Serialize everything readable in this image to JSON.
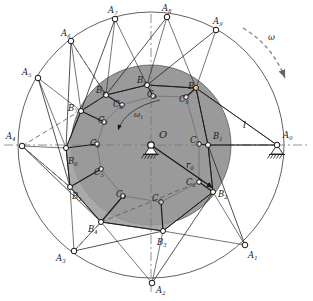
{
  "figure": {
    "background_color": "#ffffff",
    "disc_fill": "#9a9a9a",
    "line_color": "#1a1a1a",
    "marker_fill": "#ffffff",
    "dash_color": "#555555"
  },
  "labels": {
    "center": "O",
    "radius": "r",
    "radius_sub": "0",
    "link_length": "l",
    "omega": "ω",
    "omega1": "ω",
    "omega1_sub": "1"
  },
  "geometry": {
    "outer_circle": {
      "cx": 151,
      "cy": 145,
      "r": 133
    },
    "disc": {
      "cx": 151,
      "cy": 145,
      "r": 80
    },
    "pivot_center": {
      "x": 151,
      "y": 145
    },
    "pivot_ground": {
      "x": 277,
      "y": 145
    },
    "radius_arrow": {
      "x1": 151,
      "y1": 145,
      "x2": 213,
      "y2": 188
    },
    "axis_h": {
      "x1": 4,
      "y1": 145,
      "x2": 309,
      "y2": 145
    },
    "axis_v": {
      "x1": 151,
      "y1": 14,
      "x2": 151,
      "y2": 292
    }
  },
  "points": {
    "A": [
      {
        "id": "A0",
        "base": "A",
        "sub": "0",
        "x": 277,
        "y": 145,
        "lx": 283,
        "ly": 131
      },
      {
        "id": "A1",
        "base": "A",
        "sub": "1",
        "x": 245,
        "y": 245,
        "lx": 248,
        "ly": 251
      },
      {
        "id": "A2",
        "base": "A",
        "sub": "2",
        "x": 152,
        "y": 283,
        "lx": 156,
        "ly": 286
      },
      {
        "id": "A3",
        "base": "A",
        "sub": "3",
        "x": 74,
        "y": 251,
        "lx": 56,
        "ly": 254
      },
      {
        "id": "A4",
        "base": "A",
        "sub": "4",
        "x": 22,
        "y": 146,
        "lx": 6,
        "ly": 132
      },
      {
        "id": "A5",
        "base": "A",
        "sub": "5",
        "x": 38,
        "y": 78,
        "lx": 22,
        "ly": 68
      },
      {
        "id": "A6",
        "base": "A",
        "sub": "6",
        "x": 71,
        "y": 41,
        "lx": 61,
        "ly": 29
      },
      {
        "id": "A7",
        "base": "A",
        "sub": "7",
        "x": 115,
        "y": 19,
        "lx": 108,
        "ly": 6
      },
      {
        "id": "A8",
        "base": "A",
        "sub": "8",
        "x": 167,
        "y": 17,
        "lx": 162,
        "ly": 4
      },
      {
        "id": "A9",
        "base": "A",
        "sub": "9",
        "x": 216,
        "y": 30,
        "lx": 213,
        "ly": 17
      }
    ],
    "B": [
      {
        "id": "B1",
        "base": "B",
        "sub": "1",
        "x": 208,
        "y": 145,
        "lx": 213,
        "ly": 132
      },
      {
        "id": "B2",
        "base": "B",
        "sub": "2",
        "x": 213,
        "y": 192,
        "lx": 218,
        "ly": 190
      },
      {
        "id": "B3",
        "base": "B",
        "sub": "3",
        "x": 163,
        "y": 231,
        "lx": 157,
        "ly": 238
      },
      {
        "id": "B4",
        "base": "B",
        "sub": "4",
        "x": 101,
        "y": 222,
        "lx": 88,
        "ly": 225
      },
      {
        "id": "B5",
        "base": "B",
        "sub": "5",
        "x": 70,
        "y": 187,
        "lx": 72,
        "ly": 192
      },
      {
        "id": "B6",
        "base": "B",
        "sub": "6",
        "x": 66,
        "y": 148,
        "lx": 68,
        "ly": 157
      },
      {
        "id": "B7",
        "base": "B",
        "sub": "7",
        "x": 81,
        "y": 111,
        "lx": 68,
        "ly": 104
      },
      {
        "id": "B8",
        "base": "B",
        "sub": "8",
        "x": 106,
        "y": 95,
        "lx": 96,
        "ly": 86
      },
      {
        "id": "B9",
        "base": "B",
        "sub": "9",
        "x": 147,
        "y": 85,
        "lx": 137,
        "ly": 76
      },
      {
        "id": "B0",
        "base": "B",
        "sub": "0",
        "x": 196,
        "y": 88,
        "lx": 188,
        "ly": 82
      }
    ],
    "C": [
      {
        "id": "C1",
        "base": "C",
        "sub": "1",
        "x": 199,
        "y": 144,
        "lx": 190,
        "ly": 136
      },
      {
        "id": "C2",
        "base": "C",
        "sub": "2",
        "x": 199,
        "y": 182,
        "lx": 186,
        "ly": 178
      },
      {
        "id": "C3",
        "base": "C",
        "sub": "3",
        "x": 161,
        "y": 202,
        "lx": 152,
        "ly": 194
      },
      {
        "id": "C4",
        "base": "C",
        "sub": "4",
        "x": 123,
        "y": 196,
        "lx": 116,
        "ly": 190
      },
      {
        "id": "C5",
        "base": "C",
        "sub": "5",
        "x": 101,
        "y": 169,
        "lx": 94,
        "ly": 168
      },
      {
        "id": "C6",
        "base": "C",
        "sub": "6",
        "x": 97,
        "y": 144,
        "lx": 90,
        "ly": 139
      },
      {
        "id": "C7",
        "base": "C",
        "sub": "7",
        "x": 104,
        "y": 122,
        "lx": 98,
        "ly": 116
      },
      {
        "id": "C8",
        "base": "C",
        "sub": "8",
        "x": 122,
        "y": 105,
        "lx": 113,
        "ly": 100
      },
      {
        "id": "C9",
        "base": "C",
        "sub": "9",
        "x": 153,
        "y": 96,
        "lx": 147,
        "ly": 90
      },
      {
        "id": "C0",
        "base": "C",
        "sub": "0",
        "x": 186,
        "y": 97,
        "lx": 179,
        "ly": 95
      }
    ]
  },
  "annotations": {
    "omega_arc": {
      "label": "ω",
      "lx": 268,
      "ly": 33
    },
    "omega1_arc": {
      "label": "ω₁",
      "lx": 134,
      "ly": 111
    },
    "radius_label": {
      "lx": 186,
      "ly": 161
    },
    "link_label": {
      "lx": 243,
      "ly": 120
    },
    "center_label": {
      "lx": 159,
      "ly": 130
    }
  }
}
